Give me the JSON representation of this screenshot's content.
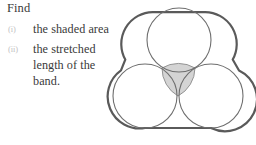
{
  "prompt": {
    "heading": "Find"
  },
  "items": [
    {
      "marker": "(i)",
      "lines": [
        "the shaded area"
      ]
    },
    {
      "marker": "(ii)",
      "lines": [
        "the stretched",
        "length of the",
        "band."
      ]
    }
  ],
  "figure": {
    "name": "three-circles-with-band-diagram",
    "stroke_color": "#5a5a5a",
    "circle_stroke_color": "#6e6e6e",
    "shade_fill": "#d4d4d4",
    "shade_stroke": "#8a8a8a",
    "band_stroke_width": 2.2,
    "circle_stroke_width": 1.1,
    "radius": 32,
    "circles": [
      {
        "label": "top-circle",
        "cx": 75,
        "cy": 40,
        "r": 32
      },
      {
        "label": "bottom-left-circle",
        "cx": 41,
        "cy": 96,
        "r": 32
      },
      {
        "label": "bottom-right-circle",
        "cx": 107,
        "cy": 96,
        "r": 32
      }
    ],
    "shaded_region": {
      "label": "curvilinear-triangle",
      "cx": 74,
      "cy": 78
    }
  }
}
